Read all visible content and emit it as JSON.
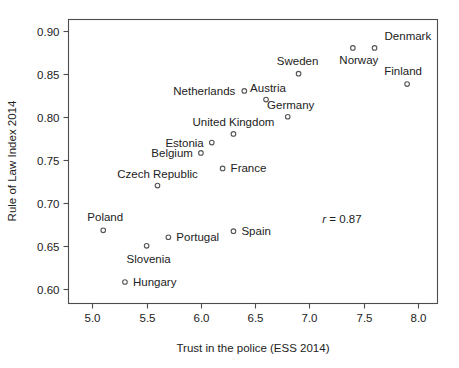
{
  "chart_data": {
    "type": "scatter",
    "title": "",
    "xlabel": "Trust in the police (ESS 2014)",
    "ylabel": "Rule of Law Index 2014",
    "xlim": [
      4.78,
      8.18
    ],
    "ylim": [
      0.583,
      0.913
    ],
    "xticks": [
      "5.0",
      "5.5",
      "6.0",
      "6.5",
      "7.0",
      "7.5",
      "8.0"
    ],
    "xtick_values": [
      5.0,
      5.5,
      6.0,
      6.5,
      7.0,
      7.5,
      8.0
    ],
    "yticks": [
      "0.60",
      "0.65",
      "0.70",
      "0.75",
      "0.80",
      "0.85",
      "0.90"
    ],
    "ytick_values": [
      0.6,
      0.65,
      0.7,
      0.75,
      0.8,
      0.85,
      0.9
    ],
    "grid": false,
    "legend": "none",
    "marker": "open-circle",
    "marker_color": "#555555",
    "annotations": [
      {
        "text_r": "r",
        "text_rest": " = 0.87",
        "x": 7.3,
        "y": 0.677
      }
    ],
    "points": [
      {
        "label": "Denmark",
        "x": 7.6,
        "y": 0.88,
        "label_dx": 10,
        "label_dy": -8,
        "anchor": "start"
      },
      {
        "label": "Norway",
        "x": 7.4,
        "y": 0.88,
        "label_dx": 6,
        "label_dy": 16,
        "anchor": "middle"
      },
      {
        "label": "Finland",
        "x": 7.9,
        "y": 0.838,
        "label_dx": -4,
        "label_dy": -9,
        "anchor": "middle"
      },
      {
        "label": "Sweden",
        "x": 6.9,
        "y": 0.85,
        "label_dx": -1,
        "label_dy": -9,
        "anchor": "middle"
      },
      {
        "label": "Netherlands",
        "x": 6.4,
        "y": 0.83,
        "label_dx": -9,
        "label_dy": 4,
        "anchor": "end"
      },
      {
        "label": "Austria",
        "x": 6.6,
        "y": 0.82,
        "label_dx": 2,
        "label_dy": -8,
        "anchor": "middle"
      },
      {
        "label": "Germany",
        "x": 6.8,
        "y": 0.8,
        "label_dx": 3,
        "label_dy": -8,
        "anchor": "middle"
      },
      {
        "label": "United Kingdom",
        "x": 6.3,
        "y": 0.78,
        "label_dx": 0,
        "label_dy": -8,
        "anchor": "middle"
      },
      {
        "label": "Estonia",
        "x": 6.1,
        "y": 0.77,
        "label_dx": -8,
        "label_dy": 4,
        "anchor": "end"
      },
      {
        "label": "Belgium",
        "x": 6.0,
        "y": 0.758,
        "label_dx": -8,
        "label_dy": 4,
        "anchor": "end"
      },
      {
        "label": "France",
        "x": 6.2,
        "y": 0.74,
        "label_dx": 8,
        "label_dy": 4,
        "anchor": "start"
      },
      {
        "label": "Czech Republic",
        "x": 5.6,
        "y": 0.72,
        "label_dx": 0,
        "label_dy": -8,
        "anchor": "middle"
      },
      {
        "label": "Poland",
        "x": 5.1,
        "y": 0.668,
        "label_dx": 2,
        "label_dy": -9,
        "anchor": "middle"
      },
      {
        "label": "Spain",
        "x": 6.3,
        "y": 0.667,
        "label_dx": 8,
        "label_dy": 4,
        "anchor": "start"
      },
      {
        "label": "Portugal",
        "x": 5.7,
        "y": 0.66,
        "label_dx": 8,
        "label_dy": 4,
        "anchor": "start"
      },
      {
        "label": "Slovenia",
        "x": 5.5,
        "y": 0.65,
        "label_dx": 2,
        "label_dy": 17,
        "anchor": "middle"
      },
      {
        "label": "Hungary",
        "x": 5.3,
        "y": 0.608,
        "label_dx": 8,
        "label_dy": 4,
        "anchor": "start"
      }
    ]
  }
}
